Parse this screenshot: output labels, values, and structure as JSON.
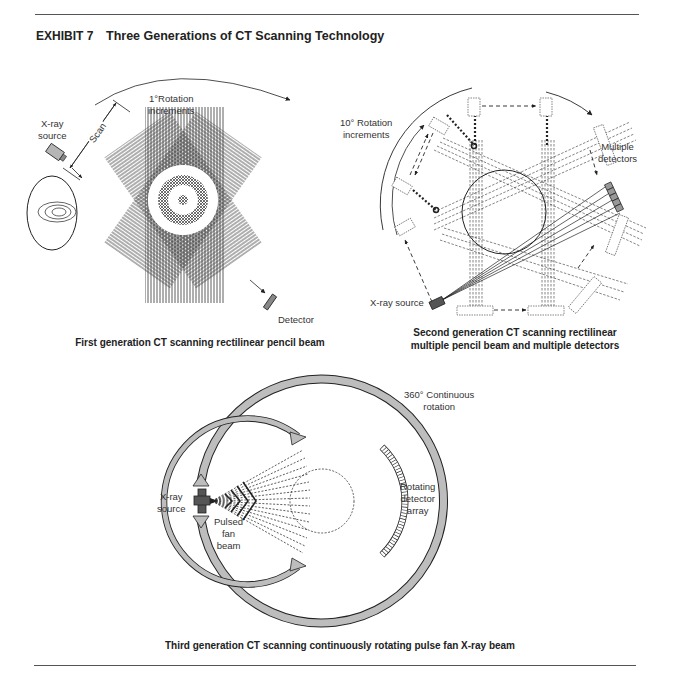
{
  "header": {
    "exhibit_label": "EXHIBIT 7",
    "title": "Three Generations of CT Scanning Technology"
  },
  "diagrams": [
    {
      "id": "first_generation",
      "caption": "First generation CT scanning rectilinear pencil beam",
      "labels": {
        "rotation": "1°Rotation",
        "rotation_2": "increments",
        "xray_1": "X-ray",
        "xray_2": "source",
        "scan": "Scan",
        "detector": "Detector"
      }
    },
    {
      "id": "second_generation",
      "caption_line1": "Second generation CT scanning rectilinear",
      "caption_line2": "multiple pencil beam and multiple detectors",
      "labels": {
        "rotation": "10° Rotation",
        "rotation_2": "increments",
        "multiple_1": "Multiple",
        "multiple_2": "detectors",
        "xray": "X-ray source"
      }
    },
    {
      "id": "third_generation",
      "caption": "Third generation CT scanning continuously rotating pulse fan X-ray beam",
      "labels": {
        "continuous_1": "360° Continuous",
        "continuous_2": "rotation",
        "xray_1": "X-ray",
        "xray_2": "source",
        "pulsed_1": "Pulsed",
        "pulsed_2": "fan",
        "pulsed_3": "beam",
        "rotating_1": "Rotating",
        "rotating_2": "detector",
        "rotating_3": "array"
      }
    }
  ],
  "colors": {
    "ink": "#222222",
    "gray_fill": "#b5b5b5",
    "dark_fill": "#555555",
    "rule": "#555555"
  }
}
